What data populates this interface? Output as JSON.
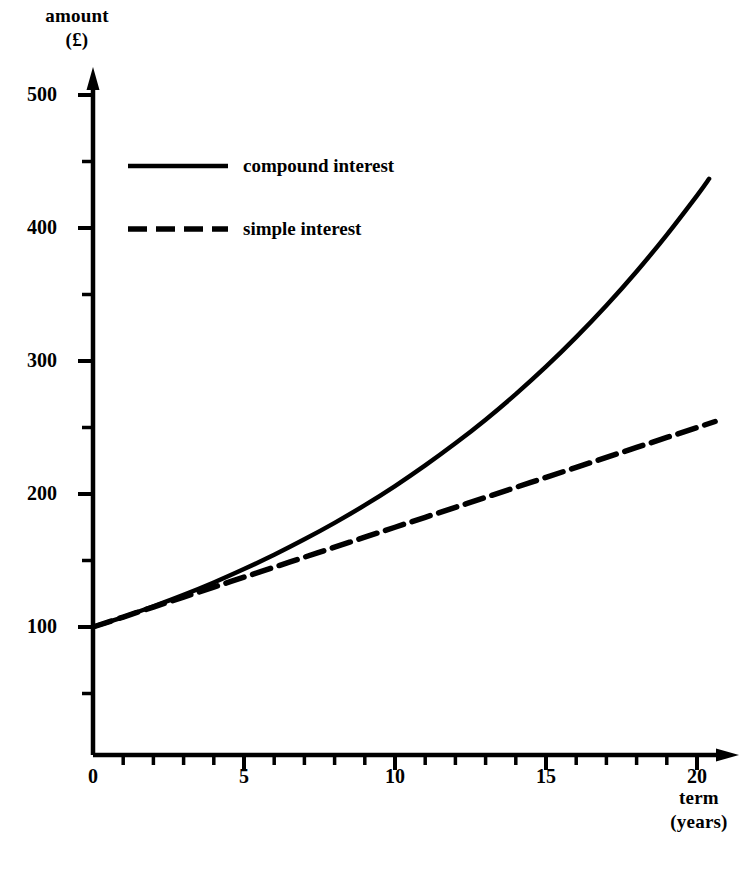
{
  "chart_data": {
    "type": "line",
    "title": "",
    "xlabel": "term (years)",
    "ylabel": "amount (£)",
    "xlabel_lines": [
      "term",
      "(years)"
    ],
    "ylabel_lines": [
      "amount",
      "(£)"
    ],
    "xlim": [
      0,
      20.5
    ],
    "ylim": [
      0,
      510
    ],
    "x_ticks_major": [
      0,
      5,
      10,
      15,
      20
    ],
    "x_tick_labels": [
      "0",
      "5",
      "10",
      "15",
      "20"
    ],
    "x_minor_step": 1,
    "y_ticks_major": [
      100,
      200,
      300,
      400,
      500
    ],
    "y_tick_labels": [
      "100",
      "200",
      "300",
      "400",
      "500"
    ],
    "y_minor_ticks": [
      50,
      150,
      250,
      350,
      450
    ],
    "grid": false,
    "legend_position": "upper-left-inside",
    "axis_color": "#000000",
    "series": [
      {
        "name": "compound interest",
        "style": "solid",
        "color": "#000000",
        "x": [
          0,
          1,
          2,
          3,
          4,
          5,
          6,
          7,
          8,
          9,
          10,
          11,
          12,
          13,
          14,
          15,
          16,
          17,
          18,
          19,
          20,
          20.4
        ],
        "values": [
          100,
          107.5,
          115.6,
          124.2,
          133.5,
          143.6,
          154.3,
          165.9,
          178.3,
          191.6,
          206.0,
          221.5,
          238.1,
          255.9,
          275.1,
          295.7,
          317.9,
          341.7,
          367.3,
          394.9,
          424.4,
          437.0
        ]
      },
      {
        "name": "simple interest",
        "style": "dashed",
        "color": "#000000",
        "x": [
          0,
          1,
          2,
          3,
          4,
          5,
          6,
          7,
          8,
          9,
          10,
          11,
          12,
          13,
          14,
          15,
          16,
          17,
          18,
          19,
          20,
          20.6
        ],
        "values": [
          100,
          107.5,
          115.0,
          122.5,
          130.0,
          137.5,
          145.0,
          152.5,
          160.0,
          167.5,
          175.0,
          182.5,
          190.0,
          197.5,
          205.0,
          212.5,
          220.0,
          227.5,
          235.0,
          242.5,
          250.0,
          254.5
        ]
      }
    ]
  },
  "legend": {
    "entries": [
      {
        "label": "compound interest",
        "style": "solid"
      },
      {
        "label": "simple interest",
        "style": "dashed"
      }
    ]
  }
}
